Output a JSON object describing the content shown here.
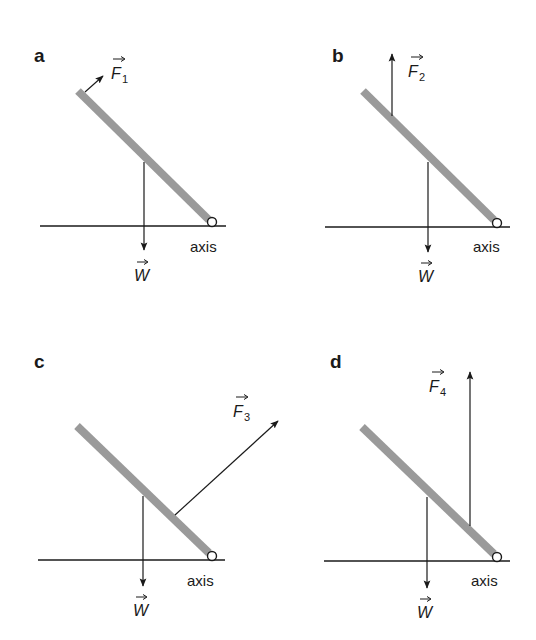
{
  "figure": {
    "colors": {
      "beam": "#9a9a9a",
      "ink": "#1a1a1a",
      "background": "#ffffff"
    },
    "panels": [
      {
        "id": "a",
        "label": "a",
        "axis_label": "axis",
        "weight_label": "W",
        "force_label": "F",
        "force_subscript": "1",
        "force_direction": "perpendicular to beam, applied at top end"
      },
      {
        "id": "b",
        "label": "b",
        "axis_label": "axis",
        "weight_label": "W",
        "force_label": "F",
        "force_subscript": "2",
        "force_direction": "vertically upward, applied near top of beam"
      },
      {
        "id": "c",
        "label": "c",
        "axis_label": "axis",
        "weight_label": "W",
        "force_label": "F",
        "force_subscript": "3",
        "force_direction": "upward-right, applied near lower part of beam"
      },
      {
        "id": "d",
        "label": "d",
        "axis_label": "axis",
        "weight_label": "W",
        "force_label": "F",
        "force_subscript": "4",
        "force_direction": "vertically upward, applied near the axis"
      }
    ]
  }
}
